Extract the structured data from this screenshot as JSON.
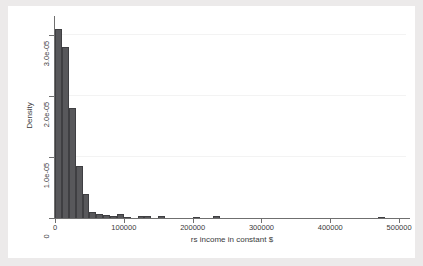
{
  "figure": {
    "background_color": "#eceaea",
    "plot_background_color": "#ffffff",
    "bar_fill_color": "#58585b",
    "bar_edge_color": "#3f3f42",
    "axis_color": "#6f6f6f",
    "gridline_color": "#f3f3f3"
  },
  "axes": {
    "x_title": "rs income in constant $",
    "y_title": "Density",
    "x_ticks": [
      "0",
      "100000",
      "200000",
      "300000",
      "400000",
      "500000"
    ],
    "x_tick_values": [
      0,
      100000,
      200000,
      300000,
      400000,
      500000
    ],
    "y_ticks": [
      "0",
      "1.0e-05",
      "2.0e-05",
      "3.0e-05"
    ],
    "y_tick_values": [
      0,
      1e-05,
      2e-05,
      3e-05
    ]
  },
  "chart_data": {
    "type": "bar",
    "title": "",
    "subtitle": "",
    "xlabel": "rs income in constant $",
    "ylabel": "Density",
    "xlim": [
      0,
      510000
    ],
    "ylim": [
      0,
      3.25e-05
    ],
    "grid": true,
    "legend": "none",
    "bin_width": 10000,
    "categories": [
      "0-10000",
      "10000-20000",
      "20000-30000",
      "30000-40000",
      "40000-50000",
      "50000-60000",
      "60000-70000",
      "70000-80000",
      "80000-90000",
      "90000-100000",
      "100000-110000",
      "110000-120000",
      "120000-130000",
      "130000-140000",
      "140000-150000",
      "150000-160000",
      "160000-170000",
      "170000-180000",
      "180000-190000",
      "190000-200000",
      "200000-210000",
      "210000-220000",
      "220000-230000",
      "230000-240000",
      "240000-250000",
      "250000-260000",
      "260000-270000",
      "270000-280000",
      "280000-290000",
      "290000-300000",
      "300000-310000",
      "310000-320000",
      "320000-330000",
      "330000-340000",
      "340000-350000",
      "350000-360000",
      "360000-370000",
      "370000-380000",
      "380000-390000",
      "390000-400000",
      "400000-410000",
      "410000-420000",
      "420000-430000",
      "430000-440000",
      "440000-450000",
      "450000-460000",
      "460000-470000",
      "470000-480000",
      "480000-490000",
      "490000-500000"
    ],
    "x": [
      5000,
      15000,
      25000,
      35000,
      45000,
      55000,
      65000,
      75000,
      85000,
      95000,
      105000,
      115000,
      125000,
      135000,
      145000,
      155000,
      165000,
      175000,
      185000,
      195000,
      205000,
      215000,
      225000,
      235000,
      245000,
      255000,
      265000,
      275000,
      285000,
      295000,
      305000,
      315000,
      325000,
      335000,
      345000,
      355000,
      365000,
      375000,
      385000,
      395000,
      405000,
      415000,
      425000,
      435000,
      445000,
      455000,
      465000,
      475000,
      485000,
      495000
    ],
    "values": [
      3.1e-05,
      2.8e-05,
      1.8e-05,
      8.5e-06,
      4e-06,
      1e-06,
      6e-07,
      5e-07,
      4e-07,
      7e-07,
      1.5e-07,
      0,
      4e-07,
      3e-07,
      0,
      3e-07,
      0,
      0,
      0,
      0,
      1.5e-07,
      0,
      0,
      2.5e-07,
      0,
      0,
      0,
      0,
      0,
      0,
      0,
      0,
      0,
      0,
      0,
      0,
      0,
      0,
      0,
      0,
      0,
      0,
      0,
      0,
      0,
      0,
      0,
      2e-07,
      0,
      0
    ],
    "series": [
      {
        "name": "Density",
        "values": [
          3.1e-05,
          2.8e-05,
          1.8e-05,
          8.5e-06,
          4e-06,
          1e-06,
          6e-07,
          5e-07,
          4e-07,
          7e-07,
          1.5e-07,
          0,
          4e-07,
          3e-07,
          0,
          3e-07,
          0,
          0,
          0,
          0,
          1.5e-07,
          0,
          0,
          2.5e-07,
          0,
          0,
          0,
          0,
          0,
          0,
          0,
          0,
          0,
          0,
          0,
          0,
          0,
          0,
          0,
          0,
          0,
          0,
          0,
          0,
          0,
          0,
          0,
          2e-07,
          0,
          0
        ]
      }
    ]
  }
}
